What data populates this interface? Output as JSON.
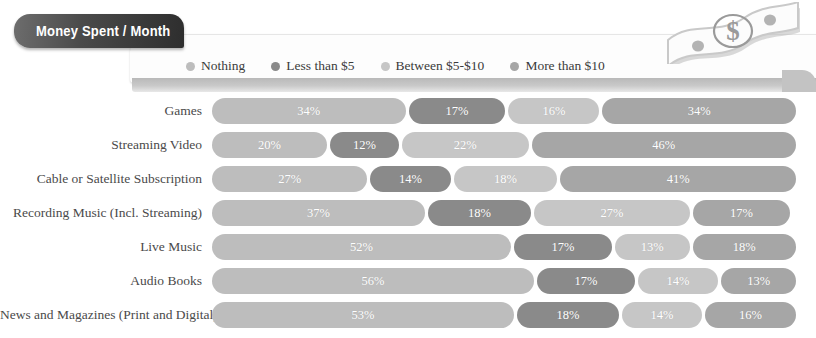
{
  "title": "Money Spent / Month",
  "decor": {
    "money_icon": "dollar-bill-icon",
    "dollar_symbol": "$"
  },
  "legend": {
    "items": [
      {
        "label": "Nothing",
        "color": "#bdbdbd"
      },
      {
        "label": "Less than $5",
        "color": "#8a8a8a"
      },
      {
        "label": "Between $5-$10",
        "color": "#c6c6c6"
      },
      {
        "label": "More than $10",
        "color": "#a6a6a6"
      }
    ]
  },
  "chart_data": {
    "type": "bar",
    "subtype": "stacked-horizontal-100",
    "title": "Money Spent / Month",
    "xlabel": "",
    "ylabel": "",
    "xlim": [
      0,
      100
    ],
    "grid": false,
    "legend_position": "top",
    "categories": [
      "Games",
      "Streaming Video",
      "Cable or  Satellite Subscription",
      "Recording Music (Incl. Streaming)",
      "Live Music",
      "Audio Books",
      "News and Magazines (Print and Digital)"
    ],
    "series": [
      {
        "name": "Nothing",
        "color": "#bdbdbd",
        "values": [
          34,
          20,
          27,
          37,
          52,
          56,
          53
        ]
      },
      {
        "name": "Less than $5",
        "color": "#8a8a8a",
        "values": [
          17,
          12,
          14,
          18,
          17,
          17,
          18
        ]
      },
      {
        "name": "Between $5-$10",
        "color": "#c6c6c6",
        "values": [
          16,
          22,
          18,
          27,
          13,
          14,
          14
        ]
      },
      {
        "name": "More than $10",
        "color": "#a6a6a6",
        "values": [
          34,
          46,
          41,
          17,
          18,
          13,
          16
        ]
      }
    ],
    "value_format": "{v}%"
  }
}
